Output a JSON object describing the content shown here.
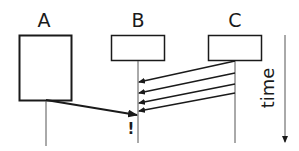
{
  "diagram": {
    "type": "sequence-diagram",
    "participants": [
      {
        "id": "A",
        "label": "A"
      },
      {
        "id": "B",
        "label": "B"
      },
      {
        "id": "C",
        "label": "C"
      }
    ],
    "messages": [
      {
        "from": "C",
        "to": "B",
        "index": 1
      },
      {
        "from": "C",
        "to": "B",
        "index": 2
      },
      {
        "from": "C",
        "to": "B",
        "index": 3
      },
      {
        "from": "C",
        "to": "B",
        "index": 4
      },
      {
        "from": "A",
        "to": "B",
        "index": 5
      }
    ],
    "marker": "!",
    "time_axis": {
      "label": "time",
      "direction": "down"
    },
    "colors": {
      "stroke": "#1a1a1a",
      "lifeline": "#555555",
      "background": "#ffffff"
    }
  }
}
